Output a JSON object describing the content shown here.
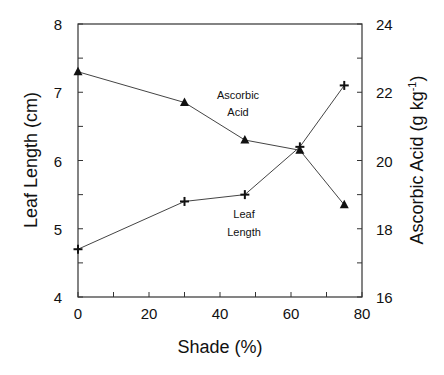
{
  "chart_data": {
    "type": "line",
    "title": "",
    "xlabel": "Shade (%)",
    "ylabel": "Leaf Length  (cm)",
    "y2label": "Ascorbic Acid (g kg",
    "y2label_sup": "-1",
    "y2label_end": ")",
    "xlim": [
      0,
      80
    ],
    "ylim": [
      4,
      8
    ],
    "y2lim": [
      16,
      24
    ],
    "x_ticks": [
      0,
      20,
      40,
      60,
      80
    ],
    "x_minor_step": 10,
    "y_ticks": [
      4,
      5,
      6,
      7,
      8
    ],
    "y_minor_step": 0.5,
    "y2_ticks": [
      16,
      18,
      20,
      22,
      24
    ],
    "y2_minor_step": 1,
    "grid": false,
    "legend": "none (inline annotations)",
    "series": [
      {
        "name": "Leaf Length",
        "axis": "left",
        "marker": "plus",
        "x": [
          0,
          30,
          47,
          62.5,
          75
        ],
        "values": [
          4.7,
          5.4,
          5.5,
          6.2,
          7.1
        ]
      },
      {
        "name": "Ascorbic Acid",
        "axis": "right",
        "marker": "triangle",
        "x": [
          0,
          30,
          47,
          62.5,
          75
        ],
        "values": [
          22.6,
          21.7,
          20.6,
          20.3,
          18.7
        ]
      }
    ],
    "annotations": [
      {
        "lines": [
          "Ascorbic",
          "Acid"
        ],
        "x": 37.5,
        "y2": 21.8
      },
      {
        "lines": [
          "Leaf",
          "Length"
        ],
        "x": 46.5,
        "y": 5.2
      }
    ]
  },
  "labels": {
    "annot_ascorbic_1": "Ascorbic",
    "annot_ascorbic_2": "Acid",
    "annot_leaf_1": "Leaf",
    "annot_leaf_2": "Length"
  }
}
